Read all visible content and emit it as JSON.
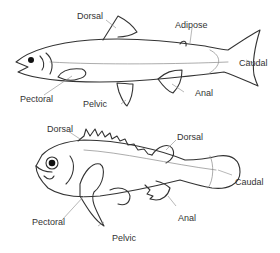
{
  "diagram": {
    "colors": {
      "outline": "#333333",
      "leader": "#999999",
      "label": "#333333",
      "background": "#ffffff"
    },
    "fish": [
      {
        "name": "Soft-rayed fish (trout-like)",
        "labels": {
          "dorsal": "Dorsal",
          "adipose": "Adipose",
          "caudal": "Caudal",
          "pectoral": "Pectoral",
          "pelvic": "Pelvic",
          "anal": "Anal"
        }
      },
      {
        "name": "Spiny-rayed fish (rockfish-like)",
        "labels": {
          "dorsal_spiny": "Dorsal",
          "dorsal_soft": "Dorsal",
          "caudal": "Caudal",
          "pectoral": "Pectoral",
          "pelvic": "Pelvic",
          "anal": "Anal"
        }
      }
    ]
  }
}
